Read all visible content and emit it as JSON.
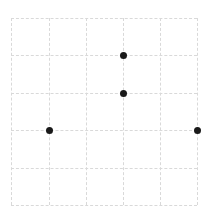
{
  "figure": {
    "width": 208,
    "height": 223,
    "background_color": "#ffffff"
  },
  "chart_data": {
    "type": "scatter",
    "title": "",
    "subtitle": "",
    "xlabel": "",
    "ylabel": "",
    "xlim": [
      0,
      5
    ],
    "ylim": [
      0,
      5
    ],
    "xticks": [
      0,
      1,
      2,
      3,
      4,
      5
    ],
    "yticks": [
      0,
      1,
      2,
      3,
      4,
      5
    ],
    "xticklabels": [
      "",
      "",
      "",
      "",
      "",
      ""
    ],
    "yticklabels": [
      "",
      "",
      "",
      "",
      "",
      ""
    ],
    "grid": true,
    "grid_style": "dashed",
    "grid_color": "#d9d9d9",
    "legend": false,
    "legend_position": "none",
    "annotations": [],
    "marker_color": "#1a1a1a",
    "marker_size": 7,
    "marker_shape": "circle",
    "series": [
      {
        "name": "points",
        "x": [
          3,
          3,
          1,
          5
        ],
        "y": [
          4,
          3,
          2,
          2
        ]
      }
    ],
    "points": [
      {
        "x": 3,
        "y": 4,
        "px": 123,
        "py": 55
      },
      {
        "x": 3,
        "y": 3,
        "px": 123,
        "py": 93
      },
      {
        "x": 1,
        "y": 2,
        "px": 49,
        "py": 130
      },
      {
        "x": 5,
        "y": 2,
        "px": 197,
        "py": 130
      }
    ],
    "gridlines": {
      "vertical_px": [
        11,
        49,
        86,
        123,
        160,
        197
      ],
      "horizontal_px": [
        18,
        55,
        93,
        130,
        168,
        205
      ]
    },
    "plot_box_px": {
      "left": 11,
      "top": 18,
      "right": 197,
      "bottom": 205
    }
  }
}
